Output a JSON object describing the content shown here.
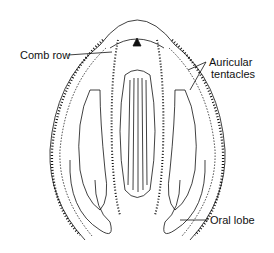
{
  "diagram": {
    "labels": {
      "comb_row": "Comb row",
      "auricular_line1": "Auricular",
      "auricular_line2": "tentacles",
      "oral_lobe": "Oral lobe"
    },
    "colors": {
      "ink": "#111111",
      "background": "#ffffff",
      "stipple": "#9a9a9a"
    }
  }
}
